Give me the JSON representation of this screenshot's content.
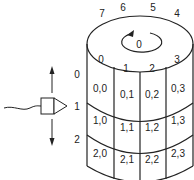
{
  "diagram": {
    "colors": {
      "stroke": "#222222",
      "background": "#ffffff"
    },
    "rotation_label": "0",
    "sector_labels_back": [
      {
        "label": "7",
        "x": 102,
        "y": 17
      },
      {
        "label": "6",
        "x": 123,
        "y": 11
      },
      {
        "label": "5",
        "x": 153,
        "y": 11
      },
      {
        "label": "4",
        "x": 177,
        "y": 17
      }
    ],
    "sector_labels_front": [
      {
        "label": "0",
        "x": 101,
        "y": 63
      },
      {
        "label": "1",
        "x": 126,
        "y": 72
      },
      {
        "label": "2",
        "x": 152,
        "y": 72
      },
      {
        "label": "3",
        "x": 177,
        "y": 63
      }
    ],
    "track_labels": [
      {
        "label": "0",
        "x": 75,
        "y": 78
      },
      {
        "label": "1",
        "x": 75,
        "y": 110
      },
      {
        "label": "2",
        "x": 75,
        "y": 143
      }
    ],
    "cells": [
      {
        "label": "0,0",
        "x": 100,
        "y": 92
      },
      {
        "label": "0,1",
        "x": 127,
        "y": 98
      },
      {
        "label": "0,2",
        "x": 152,
        "y": 98
      },
      {
        "label": "0,3",
        "x": 177,
        "y": 92
      },
      {
        "label": "1,0",
        "x": 100,
        "y": 124
      },
      {
        "label": "1,1",
        "x": 127,
        "y": 131
      },
      {
        "label": "1,2",
        "x": 152,
        "y": 131
      },
      {
        "label": "1,3",
        "x": 177,
        "y": 124
      },
      {
        "label": "2,0",
        "x": 100,
        "y": 157
      },
      {
        "label": "2,1",
        "x": 127,
        "y": 163
      },
      {
        "label": "2,2",
        "x": 152,
        "y": 163
      },
      {
        "label": "2,3",
        "x": 177,
        "y": 157
      }
    ],
    "head": {
      "name": "read-write-head",
      "movement": "up/down"
    }
  }
}
